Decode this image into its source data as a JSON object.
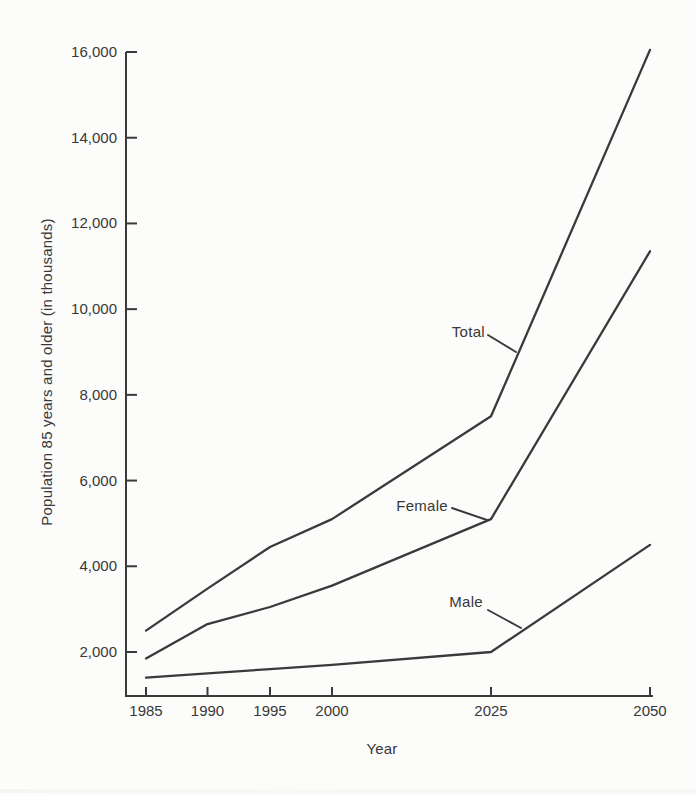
{
  "figure": {
    "background": "#fcfcfb",
    "ink": "#3a3a3a",
    "text_color": "#383838"
  },
  "chart_data": {
    "type": "line",
    "title": "",
    "xlabel": "Year",
    "ylabel": "Population 85 years and older (in thousands)",
    "categories": [
      1985,
      1990,
      1995,
      2000,
      2025,
      2050
    ],
    "x_tick_labels": [
      "1985",
      "1990",
      "1995",
      "2000",
      "2025",
      "2050"
    ],
    "x_axis_note": "non-linear spacing: equal tick gaps for 5-year intervals 1985-2000, then wider equal gaps for 25-year intervals 2000-2050",
    "y_ticks": [
      2000,
      4000,
      6000,
      8000,
      10000,
      12000,
      14000,
      16000
    ],
    "y_tick_labels": [
      "2,000",
      "4,000",
      "6,000",
      "8,000",
      "10,000",
      "12,000",
      "14,000",
      "16,000"
    ],
    "ylim": [
      1000,
      16200
    ],
    "grid": false,
    "legend": "inline series labels with leader lines",
    "series": [
      {
        "name": "Total",
        "values": [
          2500,
          3480,
          4450,
          5100,
          7500,
          16050
        ]
      },
      {
        "name": "Female",
        "values": [
          1850,
          2650,
          3050,
          3550,
          5100,
          11350
        ]
      },
      {
        "name": "Male",
        "values": [
          1400,
          1500,
          1600,
          1700,
          2000,
          4500
        ]
      }
    ]
  }
}
